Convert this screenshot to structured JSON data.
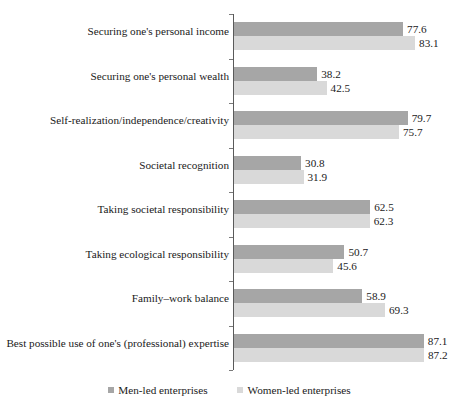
{
  "chart_data": {
    "type": "bar",
    "orientation": "horizontal",
    "title": "",
    "subtitle": "",
    "xlabel": "",
    "ylabel": "",
    "xlim": [
      0,
      87.2
    ],
    "grid": false,
    "legend_position": "bottom",
    "categories": [
      "Securing one's personal income",
      "Securing one's personal wealth",
      "Self-realization/independence/creativity",
      "Societal recognition",
      "Taking societal responsibility",
      "Taking ecological responsibility",
      "Family–work balance",
      "Best possible use of one's (professional) expertise"
    ],
    "series": [
      {
        "name": "Men-led enterprises",
        "color": "#a6a6a6",
        "values": [
          77.6,
          38.2,
          79.7,
          30.8,
          62.5,
          50.7,
          58.9,
          87.1
        ],
        "labels": [
          "77.6",
          "38.2",
          "79.7",
          "30.8",
          "62.5",
          "50.7",
          "58.9",
          "87.1"
        ]
      },
      {
        "name": "Women-led enterprises",
        "color": "#d9d9d9",
        "values": [
          83.1,
          42.5,
          75.7,
          31.9,
          62.3,
          45.6,
          69.3,
          87.2
        ],
        "labels": [
          "83.1",
          "42.5",
          "75.7",
          "31.9",
          "62.3",
          "45.6",
          "69.3",
          "87.2"
        ]
      }
    ]
  },
  "legend": {
    "items": [
      {
        "label": "Men-led enterprises",
        "color": "#a6a6a6"
      },
      {
        "label": "Women-led enterprises",
        "color": "#d9d9d9"
      }
    ]
  }
}
